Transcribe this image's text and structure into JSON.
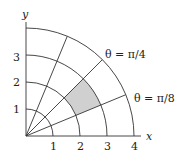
{
  "diagram": {
    "type": "polar-grid",
    "axes": {
      "x_label": "x",
      "y_label": "y"
    },
    "x_ticks": [
      "1",
      "2",
      "3",
      "4"
    ],
    "y_ticks": [
      "1",
      "2",
      "3"
    ],
    "arcs_radii": [
      1,
      2,
      3,
      4
    ],
    "ray_angles": [
      "π/8",
      "π/4",
      "3π/8"
    ],
    "annotations": [
      {
        "id": "theta_pi_4",
        "text": "θ = π/4"
      },
      {
        "id": "theta_pi_8",
        "text": "θ = π/8"
      }
    ],
    "shaded_region": {
      "r_min": 2,
      "r_max": 3,
      "theta_min": "π/8",
      "theta_max": "π/4",
      "color": "#d0d0d0"
    },
    "line_color": "#333333"
  }
}
